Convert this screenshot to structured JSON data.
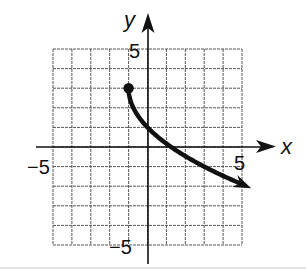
{
  "chart_data": {
    "type": "line",
    "title": "",
    "xlabel": "x",
    "ylabel": "y",
    "xlim": [
      -5,
      5
    ],
    "ylim": [
      -5,
      5
    ],
    "grid": true,
    "tick_labels": {
      "x": [
        "-5",
        "5"
      ],
      "y": [
        "5",
        "-5"
      ]
    },
    "series": [
      {
        "name": "curve",
        "equation_estimate": "y = -2*sqrt(x+1) + 3",
        "start_point": {
          "x": -1,
          "y": 3,
          "closed": true
        },
        "end": "arrow",
        "x": [
          -1,
          -0.5,
          0,
          1,
          2,
          3,
          4,
          5
        ],
        "y": [
          3,
          1.6,
          1,
          0.2,
          -0.5,
          -1,
          -1.5,
          -1.9
        ]
      }
    ]
  },
  "labels": {
    "x_axis": "x",
    "y_axis": "y",
    "x_min": "−5",
    "x_max": "5",
    "y_max": "5",
    "y_min": "−5"
  },
  "colors": {
    "grid": "#555555",
    "axes": "#111111",
    "curve": "#111111",
    "footer_line": "#cccccc"
  }
}
